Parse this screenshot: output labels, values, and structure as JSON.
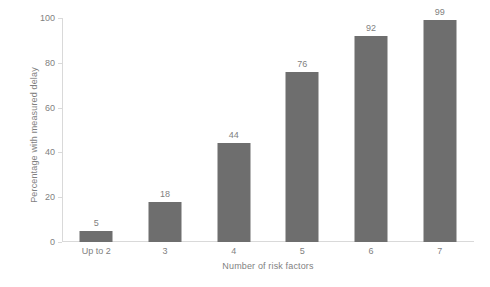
{
  "chart_data": {
    "type": "bar",
    "title": "",
    "subtitle": "",
    "xlabel": "Number of risk factors",
    "ylabel": "Percentage with measured delay",
    "categories": [
      "Up to 2",
      "3",
      "4",
      "5",
      "6",
      "7"
    ],
    "values": [
      5,
      18,
      44,
      76,
      92,
      99
    ],
    "data_labels": [
      "5",
      "18",
      "44",
      "76",
      "92",
      "99"
    ],
    "ylim": [
      0,
      100
    ],
    "y_ticks": [
      0,
      20,
      40,
      60,
      80,
      100
    ],
    "y_tick_labels": [
      "0",
      "20",
      "40",
      "60",
      "80",
      "100"
    ],
    "grid": false,
    "legend": false,
    "legend_position": "none",
    "series": [
      {
        "name": "Percentage with measured delay",
        "values": [
          5,
          18,
          44,
          76,
          92,
          99
        ],
        "color": "#6e6e6e"
      }
    ],
    "colors": {
      "bar": "#6e6e6e",
      "text": "#7f7f7f",
      "axis": "#d9d9d9",
      "background": "#ffffff"
    }
  }
}
